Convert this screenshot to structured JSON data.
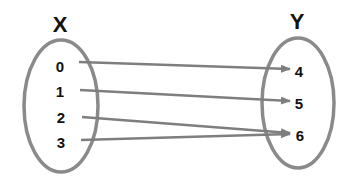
{
  "diagram": {
    "type": "mapping",
    "domain_set": {
      "label": "X",
      "elements": [
        "0",
        "1",
        "2",
        "3"
      ]
    },
    "codomain_set": {
      "label": "Y",
      "elements": [
        "4",
        "5",
        "6"
      ]
    },
    "mappings": [
      {
        "from": "0",
        "to": "4"
      },
      {
        "from": "1",
        "to": "5"
      },
      {
        "from": "2",
        "to": "6"
      },
      {
        "from": "3",
        "to": "6"
      }
    ],
    "colors": {
      "ellipse": "#8a8a8a",
      "arrow": "#7e7e7e",
      "text": "#111111"
    }
  }
}
